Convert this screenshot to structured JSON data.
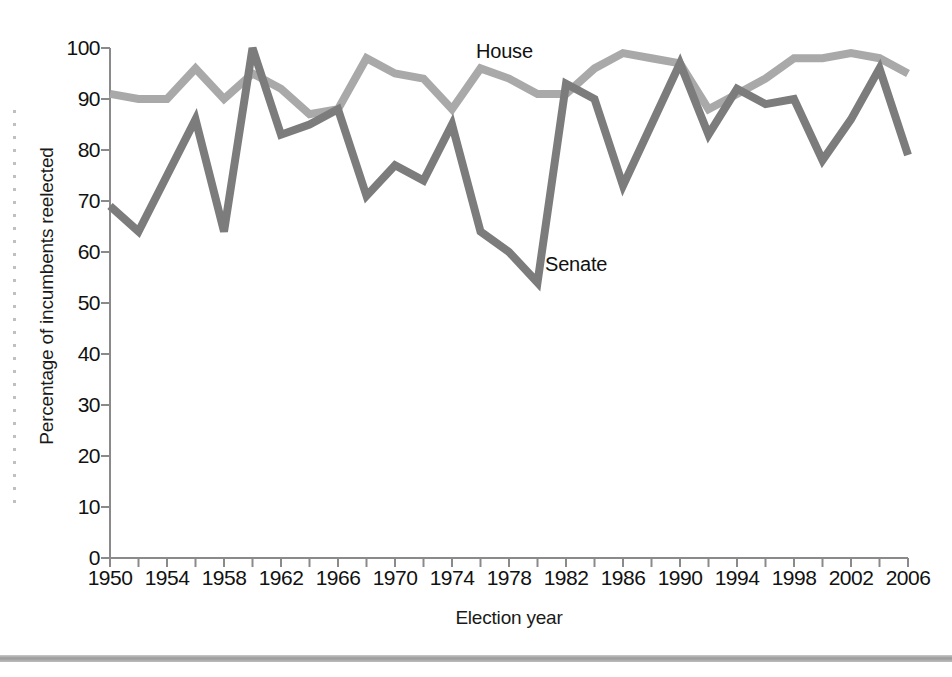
{
  "chart_data": {
    "type": "line",
    "title": "",
    "xlabel": "Election year",
    "ylabel": "Percentage of incumbents reelected",
    "xlim": [
      1950,
      2006
    ],
    "ylim": [
      0,
      100
    ],
    "grid": false,
    "legend_position": "inline-annotation",
    "x": [
      1950,
      1952,
      1954,
      1956,
      1958,
      1960,
      1962,
      1964,
      1966,
      1968,
      1970,
      1972,
      1974,
      1976,
      1978,
      1980,
      1982,
      1984,
      1986,
      1988,
      1990,
      1992,
      1994,
      1996,
      1998,
      2000,
      2002,
      2004,
      2006
    ],
    "y_ticks": [
      0,
      10,
      20,
      30,
      40,
      50,
      60,
      70,
      80,
      90,
      100
    ],
    "y_tick_labels": [
      "0",
      "10",
      "20",
      "30",
      "40",
      "50",
      "60",
      "70",
      "80",
      "90",
      "100"
    ],
    "x_ticks": [
      1950,
      1952,
      1954,
      1956,
      1958,
      1960,
      1962,
      1964,
      1966,
      1968,
      1970,
      1972,
      1974,
      1976,
      1978,
      1980,
      1982,
      1984,
      1986,
      1988,
      1990,
      1992,
      1994,
      1996,
      1998,
      2000,
      2002,
      2004,
      2006
    ],
    "x_tick_labels": [
      "1950",
      "",
      "1954",
      "",
      "1958",
      "",
      "1962",
      "",
      "1966",
      "",
      "1970",
      "",
      "1974",
      "",
      "1978",
      "",
      "1982",
      "",
      "1986",
      "",
      "1990",
      "",
      "1994",
      "",
      "1998",
      "",
      "2002",
      "",
      "2006"
    ],
    "series": [
      {
        "name": "House",
        "color": "#a9a9a9",
        "annotation": "House",
        "values": [
          91,
          90,
          90,
          96,
          90,
          95,
          92,
          87,
          88,
          98,
          95,
          94,
          88,
          96,
          94,
          91,
          91,
          96,
          99,
          98,
          97,
          88,
          91,
          94,
          98,
          98,
          99,
          98,
          95
        ]
      },
      {
        "name": "Senate",
        "color": "#7c7c7c",
        "annotation": "Senate",
        "values": [
          69,
          64,
          75,
          86,
          64,
          100,
          83,
          85,
          88,
          71,
          77,
          74,
          85,
          64,
          60,
          54,
          93,
          90,
          73,
          85,
          97,
          83,
          92,
          89,
          90,
          78,
          86,
          96,
          79
        ]
      }
    ]
  },
  "axis": {
    "y_axis_name": "percentage-axis",
    "x_axis_name": "election-year-axis"
  }
}
